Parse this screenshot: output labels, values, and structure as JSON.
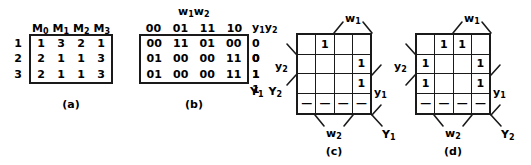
{
  "figure": {
    "captions": {
      "a": "(a)",
      "b": "(b)",
      "c": "(c)",
      "d": "(d)"
    }
  },
  "table_a": {
    "column_headers": [
      "M",
      "M",
      "M",
      "M"
    ],
    "column_header_subs": [
      "0",
      "1",
      "2",
      "3"
    ],
    "row_labels": [
      "1",
      "2",
      "3"
    ],
    "rows": [
      [
        "1",
        "3",
        "2",
        "1"
      ],
      [
        "2",
        "1",
        "1",
        "3"
      ],
      [
        "2",
        "1",
        "1",
        "3"
      ]
    ]
  },
  "table_b": {
    "top_label": {
      "base1": "w",
      "sub1": "1",
      "base2": "w",
      "sub2": "2"
    },
    "column_headers": [
      "00",
      "01",
      "11",
      "10"
    ],
    "rows": [
      [
        "00",
        "11",
        "01",
        "00"
      ],
      [
        "01",
        "00",
        "00",
        "11"
      ],
      [
        "01",
        "00",
        "00",
        "11"
      ]
    ],
    "state_header": {
      "base1": "y",
      "sub1": "1",
      "base2": "y",
      "sub2": "2"
    },
    "state_values": [
      "0 0",
      "0 1",
      "1 1"
    ],
    "output_label": {
      "base1": "Y",
      "sub1": "1",
      "base2": "Y",
      "sub2": "2"
    }
  },
  "kmap_c": {
    "cells": [
      [
        "",
        "1",
        "",
        ""
      ],
      [
        "",
        "",
        "",
        "1"
      ],
      [
        "",
        "",
        "",
        "1"
      ],
      [
        "—",
        "—",
        "—",
        "—"
      ]
    ],
    "label_w1": {
      "base": "w",
      "sub": "1"
    },
    "label_w2": {
      "base": "w",
      "sub": "2"
    },
    "label_y1": {
      "base": "y",
      "sub": "1"
    },
    "label_y2": {
      "base": "y",
      "sub": "2"
    },
    "output": {
      "base": "Y",
      "sub": "1"
    }
  },
  "kmap_d": {
    "cells": [
      [
        "",
        "1",
        "1",
        ""
      ],
      [
        "1",
        "",
        "",
        "1"
      ],
      [
        "1",
        "",
        "",
        "1"
      ],
      [
        "—",
        "—",
        "—",
        "—"
      ]
    ],
    "label_w1": {
      "base": "w",
      "sub": "1"
    },
    "label_w2": {
      "base": "w",
      "sub": "2"
    },
    "label_y1": {
      "base": "y",
      "sub": "1"
    },
    "label_y2": {
      "base": "y",
      "sub": "2"
    },
    "output": {
      "base": "Y",
      "sub": "2"
    }
  },
  "style": {
    "ink": "#1a1a1a",
    "background": "#ffffff"
  }
}
